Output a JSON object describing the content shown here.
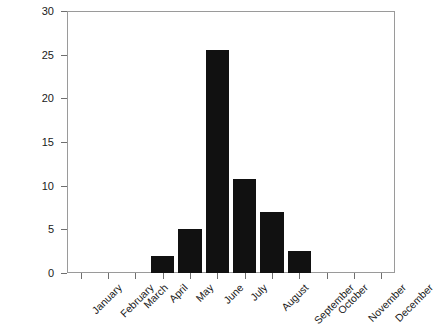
{
  "chart_data": {
    "type": "bar",
    "title": "",
    "subtitle": "",
    "xlabel": "",
    "ylabel": "Testaments",
    "categories": [
      "January",
      "February",
      "March",
      "April",
      "May",
      "June",
      "July",
      "August",
      "September",
      "October",
      "November",
      "December"
    ],
    "values": [
      0,
      0,
      0,
      2,
      5,
      25.5,
      10.8,
      7,
      2.5,
      0,
      0,
      0
    ],
    "series": [
      {
        "name": "Testaments",
        "values": [
          0,
          0,
          0,
          2,
          5,
          25.5,
          10.8,
          7,
          2.5,
          0,
          0,
          0
        ]
      }
    ],
    "ylim": [
      0,
      30
    ],
    "ytick_labels": [
      "0",
      "5",
      "10",
      "15",
      "20",
      "25",
      "30"
    ],
    "ytick_values": [
      0,
      5,
      10,
      15,
      20,
      25,
      30
    ],
    "grid": false,
    "legend": false,
    "legend_position": "none",
    "bar_color": "#111111",
    "frame_color": "#9a9a9a",
    "background_color": "#ffffff",
    "xtick_label_rotation": -45,
    "annotations": []
  }
}
